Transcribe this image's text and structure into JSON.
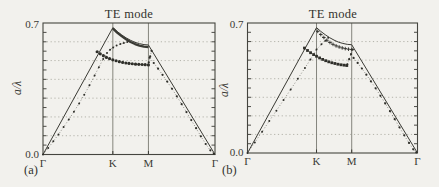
{
  "figure": {
    "background": "#f2f1ed",
    "ink": "#3a3a34",
    "grid_color": "#a3a399",
    "marker_color": "#2f2f2a"
  },
  "chart_data": [
    {
      "type": "line",
      "panel_label": "(a)",
      "title": "TE mode",
      "ylabel": "a/λ",
      "xlabel": "",
      "ylim": [
        0,
        0.7
      ],
      "grid": "dotted-horizontal",
      "legend": "none",
      "minor_tick_step": 0.05,
      "gridlines": [
        0.1,
        0.2,
        0.3,
        0.4,
        0.5,
        0.6
      ],
      "yticks": [
        {
          "v": 0.7,
          "label": "0.7"
        },
        {
          "v": 0.0,
          "label": "0.0"
        }
      ],
      "xticks": [
        {
          "pos": 0.0,
          "label": "Γ"
        },
        {
          "pos": 0.406,
          "label": "K"
        },
        {
          "pos": 0.613,
          "label": "M"
        },
        {
          "pos": 1.0,
          "label": "Γ"
        }
      ],
      "series": [
        {
          "name": "light-line",
          "kind": "line",
          "width": 1.0,
          "points": [
            [
              0,
              0
            ],
            [
              0.406,
              0.675
            ],
            [
              0.431,
              0.655
            ],
            [
              0.457,
              0.637
            ],
            [
              0.483,
              0.621
            ],
            [
              0.509,
              0.608
            ],
            [
              0.535,
              0.597
            ],
            [
              0.561,
              0.59
            ],
            [
              0.587,
              0.585
            ],
            [
              0.613,
              0.583
            ],
            [
              1,
              0
            ]
          ]
        },
        {
          "name": "upper-band",
          "kind": "line",
          "width": 2.3,
          "points": [
            [
              0.406,
              0.671
            ],
            [
              0.431,
              0.649
            ],
            [
              0.457,
              0.63
            ],
            [
              0.483,
              0.613
            ],
            [
              0.509,
              0.599
            ],
            [
              0.535,
              0.588
            ],
            [
              0.561,
              0.58
            ],
            [
              0.587,
              0.574
            ],
            [
              0.613,
              0.571
            ]
          ]
        },
        {
          "name": "band-1-rising",
          "kind": "markers",
          "marker": "dot",
          "size": 1.0,
          "connect": true,
          "points": [
            [
              0,
              0
            ],
            [
              0.03,
              0.034
            ],
            [
              0.06,
              0.07
            ],
            [
              0.09,
              0.107
            ],
            [
              0.12,
              0.146
            ],
            [
              0.15,
              0.186
            ],
            [
              0.18,
              0.228
            ],
            [
              0.21,
              0.272
            ],
            [
              0.24,
              0.318
            ],
            [
              0.27,
              0.368
            ],
            [
              0.3,
              0.42
            ],
            [
              0.325,
              0.465
            ],
            [
              0.35,
              0.508
            ],
            [
              0.372,
              0.54
            ],
            [
              0.39,
              0.558
            ],
            [
              0.408,
              0.57
            ],
            [
              0.428,
              0.58
            ],
            [
              0.45,
              0.588
            ],
            [
              0.47,
              0.594
            ],
            [
              0.49,
              0.599
            ]
          ]
        },
        {
          "name": "band-flat",
          "kind": "markers",
          "marker": "dot",
          "size": 1.6,
          "connect": true,
          "points": [
            [
              0.315,
              0.547
            ],
            [
              0.333,
              0.536
            ],
            [
              0.351,
              0.526
            ],
            [
              0.369,
              0.517
            ],
            [
              0.387,
              0.51
            ],
            [
              0.406,
              0.504
            ],
            [
              0.425,
              0.499
            ],
            [
              0.444,
              0.494
            ],
            [
              0.463,
              0.49
            ],
            [
              0.482,
              0.487
            ],
            [
              0.5,
              0.485
            ],
            [
              0.519,
              0.483
            ],
            [
              0.538,
              0.481
            ],
            [
              0.557,
              0.48
            ],
            [
              0.576,
              0.479
            ],
            [
              0.594,
              0.478
            ],
            [
              0.613,
              0.477
            ]
          ]
        },
        {
          "name": "band-riser",
          "kind": "markers",
          "marker": "dot",
          "size": 1.1,
          "connect": true,
          "points": [
            [
              0.615,
              0.49
            ],
            [
              0.623,
              0.522
            ],
            [
              0.631,
              0.552
            ]
          ]
        },
        {
          "name": "band-descending",
          "kind": "markers",
          "marker": "dot",
          "size": 1.1,
          "connect": true,
          "points": [
            [
              0.62,
              0.515
            ],
            [
              0.644,
              0.487
            ],
            [
              0.669,
              0.457
            ],
            [
              0.695,
              0.424
            ],
            [
              0.722,
              0.388
            ],
            [
              0.75,
              0.35
            ],
            [
              0.778,
              0.31
            ],
            [
              0.806,
              0.268
            ],
            [
              0.834,
              0.226
            ],
            [
              0.862,
              0.183
            ],
            [
              0.89,
              0.14
            ],
            [
              0.918,
              0.097
            ],
            [
              0.946,
              0.056
            ],
            [
              0.973,
              0.022
            ],
            [
              0.993,
              0.004
            ]
          ]
        }
      ]
    },
    {
      "type": "line",
      "panel_label": "(b)",
      "title": "TE mode",
      "ylabel": "a/λ",
      "xlabel": "",
      "ylim": [
        0,
        0.7
      ],
      "grid": "dotted-horizontal",
      "legend": "none",
      "minor_tick_step": 0.05,
      "gridlines": [
        0.1,
        0.2,
        0.3,
        0.4,
        0.5,
        0.6
      ],
      "yticks": [
        {
          "v": 0.7,
          "label": "0.7"
        },
        {
          "v": 0.0,
          "label": "0.0"
        }
      ],
      "xticks": [
        {
          "pos": 0.0,
          "label": "Γ"
        },
        {
          "pos": 0.406,
          "label": "K"
        },
        {
          "pos": 0.613,
          "label": "M"
        },
        {
          "pos": 1.0,
          "label": "Γ"
        }
      ],
      "series": [
        {
          "name": "light-line",
          "kind": "line",
          "width": 1.0,
          "points": [
            [
              0,
              0
            ],
            [
              0.406,
              0.675
            ],
            [
              0.431,
              0.655
            ],
            [
              0.457,
              0.637
            ],
            [
              0.483,
              0.621
            ],
            [
              0.509,
              0.608
            ],
            [
              0.535,
              0.597
            ],
            [
              0.561,
              0.59
            ],
            [
              0.587,
              0.585
            ],
            [
              0.613,
              0.583
            ],
            [
              1,
              0
            ]
          ]
        },
        {
          "name": "upper-band-leaky",
          "kind": "markers",
          "marker": "plus",
          "size": 1.8,
          "connect": true,
          "points": [
            [
              0.413,
              0.655
            ],
            [
              0.431,
              0.638
            ],
            [
              0.449,
              0.622
            ],
            [
              0.467,
              0.607
            ],
            [
              0.485,
              0.595
            ],
            [
              0.503,
              0.585
            ],
            [
              0.521,
              0.577
            ],
            [
              0.539,
              0.571
            ],
            [
              0.557,
              0.566
            ],
            [
              0.575,
              0.562
            ],
            [
              0.594,
              0.559
            ],
            [
              0.613,
              0.557
            ]
          ]
        },
        {
          "name": "band-1-rising",
          "kind": "markers",
          "marker": "dot",
          "size": 1.0,
          "connect": true,
          "points": [
            [
              0,
              0
            ],
            [
              0.043,
              0.057
            ],
            [
              0.086,
              0.115
            ],
            [
              0.128,
              0.172
            ],
            [
              0.17,
              0.228
            ],
            [
              0.212,
              0.285
            ],
            [
              0.254,
              0.342
            ],
            [
              0.296,
              0.4
            ],
            [
              0.338,
              0.458
            ],
            [
              0.37,
              0.503
            ],
            [
              0.406,
              0.557
            ],
            [
              0.435,
              0.585
            ],
            [
              0.458,
              0.605
            ],
            [
              0.475,
              0.62
            ]
          ]
        },
        {
          "name": "band-flat",
          "kind": "markers",
          "marker": "square",
          "size": 1.4,
          "connect": true,
          "points": [
            [
              0.335,
              0.565
            ],
            [
              0.353,
              0.552
            ],
            [
              0.371,
              0.54
            ],
            [
              0.389,
              0.53
            ],
            [
              0.406,
              0.521
            ],
            [
              0.424,
              0.512
            ],
            [
              0.442,
              0.504
            ],
            [
              0.46,
              0.497
            ],
            [
              0.478,
              0.491
            ],
            [
              0.496,
              0.486
            ],
            [
              0.514,
              0.482
            ],
            [
              0.532,
              0.478
            ],
            [
              0.55,
              0.475
            ],
            [
              0.568,
              0.473
            ],
            [
              0.584,
              0.471
            ]
          ]
        },
        {
          "name": "band-riser",
          "kind": "markers",
          "marker": "dot",
          "size": 1.1,
          "connect": true,
          "points": [
            [
              0.587,
              0.478
            ],
            [
              0.598,
              0.505
            ],
            [
              0.609,
              0.532
            ],
            [
              0.619,
              0.557
            ]
          ]
        },
        {
          "name": "band-descending",
          "kind": "markers",
          "marker": "dot",
          "size": 1.1,
          "connect": true,
          "points": [
            [
              0.624,
              0.512
            ],
            [
              0.648,
              0.485
            ],
            [
              0.673,
              0.455
            ],
            [
              0.699,
              0.422
            ],
            [
              0.726,
              0.386
            ],
            [
              0.754,
              0.348
            ],
            [
              0.782,
              0.308
            ],
            [
              0.81,
              0.267
            ],
            [
              0.838,
              0.225
            ],
            [
              0.866,
              0.182
            ],
            [
              0.894,
              0.138
            ],
            [
              0.922,
              0.095
            ],
            [
              0.95,
              0.054
            ],
            [
              0.975,
              0.02
            ],
            [
              0.993,
              0.003
            ]
          ]
        }
      ]
    }
  ]
}
